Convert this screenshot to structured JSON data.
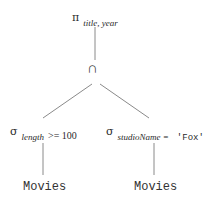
{
  "diagram": {
    "type": "relational-algebra-expression-tree",
    "colors": {
      "text": "#2a2a2a",
      "edge": "#8a8a8a",
      "background": "#ffffff"
    },
    "root": {
      "operator_symbol": "π",
      "operator_name": "projection",
      "subscript": "title, year"
    },
    "intersection": {
      "operator_symbol": "∩",
      "operator_name": "intersection"
    },
    "left_select": {
      "operator_symbol": "σ",
      "operator_name": "selection",
      "attribute": "length",
      "condition": ">= 100"
    },
    "right_select": {
      "operator_symbol": "σ",
      "operator_name": "selection",
      "attribute": "studioName =",
      "literal": "'Fox'"
    },
    "left_relation": {
      "label": "Movies"
    },
    "right_relation": {
      "label": "Movies"
    },
    "edges": [
      {
        "from": "root",
        "to": "intersection"
      },
      {
        "from": "intersection",
        "to": "left_select"
      },
      {
        "from": "intersection",
        "to": "right_select"
      },
      {
        "from": "left_select",
        "to": "left_relation"
      },
      {
        "from": "right_select",
        "to": "right_relation"
      }
    ]
  }
}
